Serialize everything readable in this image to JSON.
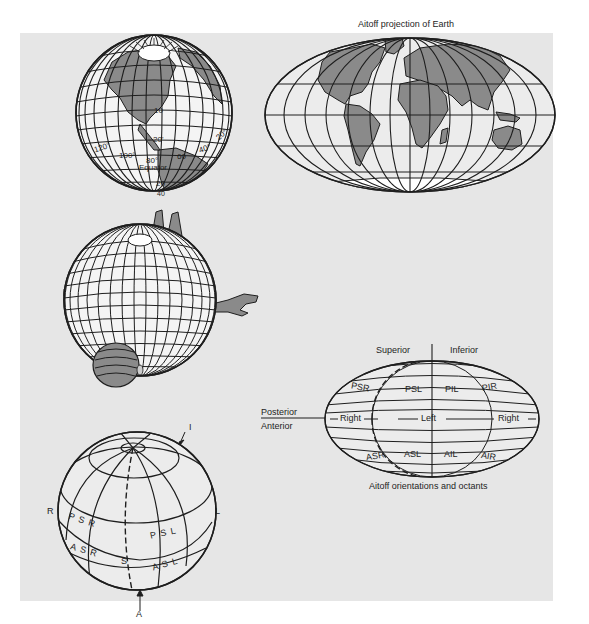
{
  "figure": {
    "colors": {
      "background": "#ffffff",
      "panel": "#e6e6e6",
      "line": "#1e1e1e",
      "land": "#8a8a8a",
      "sphere_fill": "#f2f2f2"
    },
    "globe_earth": {
      "labels": {
        "lat_10": "10",
        "lat_20_n": "20'",
        "lon_120": "120°",
        "lon_100": "100°",
        "lon_80": "80°",
        "equator": "Equator",
        "lon_60": "60",
        "lon_40": "40°",
        "lon_20": "20°",
        "lat_20_s": "20",
        "lat_40_s": "40"
      }
    },
    "aitoff_earth": {
      "title": "Aitoff projection of Earth"
    },
    "head_globe": {},
    "octant_globe": {
      "labels": {
        "top": "I",
        "bottom": "A",
        "left": "R",
        "right": "L",
        "psr": "P S R",
        "psl": "P S L",
        "asr": "A S R",
        "asl": "A S L",
        "s": "S"
      }
    },
    "aitoff_octants": {
      "title": "Aitoff orientations and octants",
      "superior": "Superior",
      "inferior": "Inferior",
      "posterior": "Posterior",
      "anterior": "Anterior",
      "right_left": "Right",
      "left_center": "Left",
      "right_right": "Right",
      "octants": {
        "psr": "PSR",
        "psl": "PSL",
        "pil": "PIL",
        "pir": "PIR",
        "asr": "ASR",
        "asl": "ASL",
        "ail": "AIL",
        "air": "AIR"
      }
    }
  }
}
